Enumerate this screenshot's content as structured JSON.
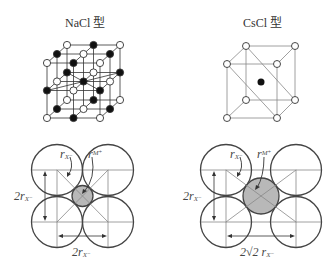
{
  "figure": {
    "left_panel": {
      "title": "NaCl 型",
      "lattice_label": "rock-salt lattice (3×3×3 nodes, alternating anions/cations)",
      "section": {
        "label_r_anion": "r",
        "label_r_anion_sub": "X⁻",
        "label_r_cation": "r",
        "label_r_cation_sub": "M⁺",
        "vertical_dim": "2r",
        "vertical_dim_sub": "X⁻",
        "horizontal_dim": "2r",
        "horizontal_dim_sub": "X⁻"
      }
    },
    "right_panel": {
      "title": "CsCl 型",
      "lattice_label": "body-centered cubic lattice",
      "section": {
        "label_r_anion": "r",
        "label_r_anion_sub": "X⁻",
        "label_r_cation": "r",
        "label_r_cation_sub": "M⁺",
        "vertical_dim": "2r",
        "vertical_dim_sub": "X⁻",
        "horizontal_dim": "2√2 r",
        "horizontal_dim_sub": "X⁻"
      }
    },
    "colors": {
      "line": "#333333",
      "anion_fill": "#ffffff",
      "cation_fill": "#111111",
      "small_ion_fill": "#b8b8b8"
    }
  }
}
